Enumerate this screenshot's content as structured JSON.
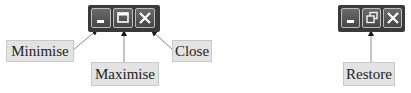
{
  "left_diagram": {
    "buttons": [
      {
        "name": "minimise",
        "icon": "minimise-icon"
      },
      {
        "name": "maximise",
        "icon": "maximise-icon"
      },
      {
        "name": "close",
        "icon": "close-icon"
      }
    ],
    "labels": {
      "minimise": "Minimise",
      "maximise": "Maximise",
      "close": "Close"
    }
  },
  "right_diagram": {
    "buttons": [
      {
        "name": "minimise",
        "icon": "minimise-icon"
      },
      {
        "name": "restore",
        "icon": "restore-icon"
      },
      {
        "name": "close",
        "icon": "close-icon"
      }
    ],
    "labels": {
      "restore": "Restore"
    }
  },
  "colors": {
    "bar": "#3a3a3a",
    "label_bg": "#e3e3e3",
    "arrow": "#7f7f7f"
  }
}
